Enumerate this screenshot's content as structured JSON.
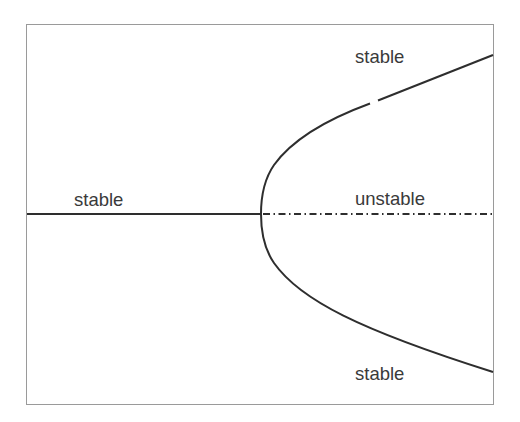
{
  "diagram": {
    "type": "pitchfork-bifurcation",
    "colors": {
      "frame": "#9a9a9a",
      "curve": "#2e2e2e",
      "text": "#3a3a3a",
      "background": "#ffffff"
    },
    "labels": {
      "left_branch": "stable",
      "upper_branch": "stable",
      "middle_branch": "unstable",
      "lower_branch": "stable"
    },
    "branches": [
      {
        "name": "left-trivial-branch",
        "style": "solid",
        "stability": "stable"
      },
      {
        "name": "right-trivial-branch",
        "style": "dash-dot",
        "stability": "unstable"
      },
      {
        "name": "upper-parabolic-branch",
        "style": "solid",
        "stability": "stable"
      },
      {
        "name": "lower-parabolic-branch",
        "style": "solid",
        "stability": "stable"
      }
    ]
  }
}
